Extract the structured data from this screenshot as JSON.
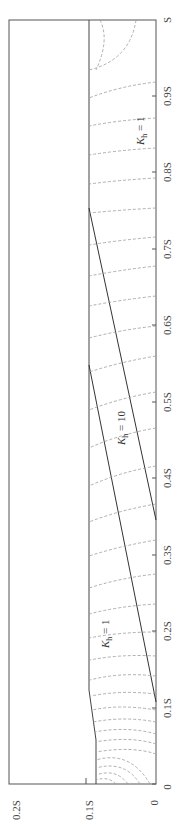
{
  "figure": {
    "orientation": "rotated-90-ccw",
    "x_axis": {
      "label_suffix": "S",
      "ticks": [
        "0",
        "0.1S",
        "0.2S",
        "0.3S",
        "0.4S",
        "0.5S",
        "0.6S",
        "0.7S",
        "0.8S",
        "0.9S",
        "S"
      ]
    },
    "y_axis": {
      "ticks": [
        "0",
        "0.1S",
        "0.2S"
      ]
    },
    "regions": [
      {
        "label_k": "K",
        "label_sub": "h",
        "label_eq": " = 1",
        "position": "left-upper"
      },
      {
        "label_k": "K",
        "label_sub": "h",
        "label_eq": " = 10",
        "position": "middle-band"
      },
      {
        "label_k": "K",
        "label_sub": "h",
        "label_eq": " = 1",
        "position": "right"
      }
    ],
    "boundaries": {
      "top_surface_height": "0.1S",
      "lower_interface": {
        "from_bottom_x": "0.1S",
        "to_top_x": "0.55S"
      },
      "upper_interface": {
        "from_bottom_x": "0.35S",
        "to_top_x": "0.75S"
      }
    },
    "colors": {
      "frame": "#555555",
      "interface": "#333333",
      "equipotential": "#9a9a9a"
    }
  }
}
